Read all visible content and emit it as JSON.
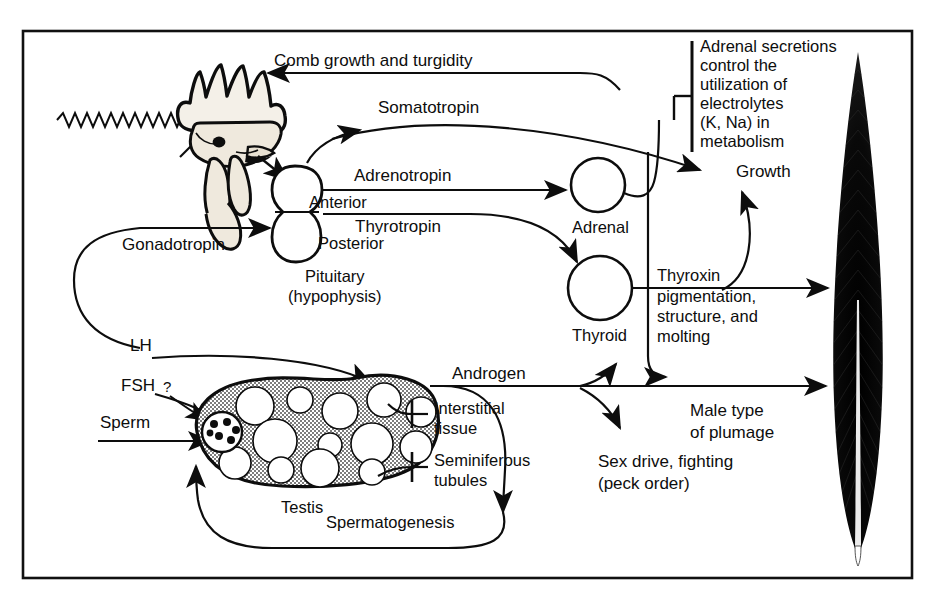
{
  "figure": {
    "domain": "biological-flow-diagram",
    "background_color": "#ffffff",
    "ink_color": "#0d0d0d",
    "testis_fill_color": "#b3b3b3",
    "border": {
      "present": true,
      "color": "#111111"
    }
  },
  "labels": {
    "light": "Light",
    "comb_growth": "Comb growth and turgidity",
    "somatotropin": "Somatotropin",
    "adrenotropin": "Adrenotropin",
    "thyrotropin": "Thyrotropin",
    "anterior": "Anterior",
    "posterior": "Posterior",
    "pituitary": "Pituitary",
    "hypophysis": "(hypophysis)",
    "gonadotropin": "Gonadotropin",
    "adrenal": "Adrenal",
    "thyroid": "Thyroid",
    "growth": "Growth",
    "lh": "LH",
    "fsh": "FSH",
    "question": "?",
    "sperm": "Sperm",
    "testis": "Testis",
    "spermatogenesis": "Spermatogenesis",
    "androgen": "Androgen",
    "interstitial_1": "Interstitial",
    "interstitial_2": "tissue",
    "seminiferous_1": "Seminiferous",
    "seminiferous_2": "tubules",
    "male_plumage_1": "Male type",
    "male_plumage_2": "of plumage",
    "sex_drive_1": "Sex drive, fighting",
    "sex_drive_2": "(peck order)",
    "thyroxin_1": "Thyroxin",
    "thyroxin_2": "pigmentation,",
    "thyroxin_3": "structure, and",
    "thyroxin_4": "molting",
    "adrenal_note_1": "Adrenal secretions",
    "adrenal_note_2": "control the",
    "adrenal_note_3": "utilization of",
    "adrenal_note_4": "electrolytes",
    "adrenal_note_5": "(K, Na) in",
    "adrenal_note_6": "metabolism"
  },
  "organs": [
    {
      "name": "rooster-head",
      "kind": "illustration"
    },
    {
      "name": "pituitary",
      "kind": "gland",
      "shape": "figure-eight"
    },
    {
      "name": "adrenal",
      "kind": "gland",
      "shape": "circle"
    },
    {
      "name": "thyroid",
      "kind": "gland",
      "shape": "circle"
    },
    {
      "name": "testis",
      "kind": "gonad",
      "shape": "bean"
    },
    {
      "name": "feather",
      "kind": "illustration"
    }
  ],
  "pathways": [
    {
      "from": "light",
      "to": "pituitary",
      "label": "Light"
    },
    {
      "from": "adrenal-secretions",
      "to": "comb",
      "label": "Comb growth and turgidity"
    },
    {
      "from": "pituitary-anterior",
      "to": "growth",
      "label": "Somatotropin"
    },
    {
      "from": "pituitary-anterior",
      "to": "adrenal",
      "label": "Adrenotropin"
    },
    {
      "from": "pituitary-anterior",
      "to": "thyroid",
      "label": "Thyrotropin"
    },
    {
      "from": "pituitary-posterior",
      "to": "testis",
      "label": "Gonadotropin"
    },
    {
      "from": "thyroid",
      "to": "feather",
      "label": "Thyroxin pigmentation, structure, and molting"
    },
    {
      "from": "testis",
      "to": "feather",
      "label": "Androgen"
    },
    {
      "from": "androgen",
      "to": "sex-drive",
      "label": "Sex drive, fighting (peck order)"
    },
    {
      "from": "androgen",
      "to": "plumage",
      "label": "Male type of plumage"
    },
    {
      "from": "testis",
      "to": "testis",
      "label": "Spermatogenesis"
    }
  ]
}
